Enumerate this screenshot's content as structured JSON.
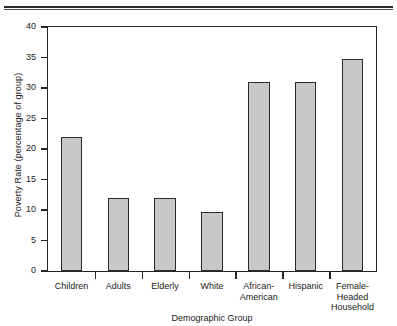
{
  "chart_data": {
    "type": "bar",
    "title": "",
    "xlabel": "Demographic Group",
    "ylabel": "Poverty Rate (percentage of group)",
    "categories": [
      "Children",
      "Adults",
      "Elderly",
      "White",
      "African-\nAmerican",
      "Hispanic",
      "Female-\nHeaded\nHousehold"
    ],
    "values": [
      22,
      12,
      11.9,
      9.7,
      31,
      31,
      34.8
    ],
    "ylim": [
      0,
      40
    ],
    "ytick_labels": [
      "0",
      "5",
      "10",
      "15",
      "20",
      "25",
      "30",
      "35",
      "40"
    ],
    "ytick_values": [
      0,
      5,
      10,
      15,
      20,
      25,
      30,
      35,
      40
    ],
    "grid": false,
    "legend": false,
    "bar_color": "#c8c8c8",
    "bar_border_color": "#2b2b2b",
    "axis_color": "#262626",
    "background": "#ffffff"
  },
  "figure": {
    "top_rule_color": "#2b2b2b"
  }
}
